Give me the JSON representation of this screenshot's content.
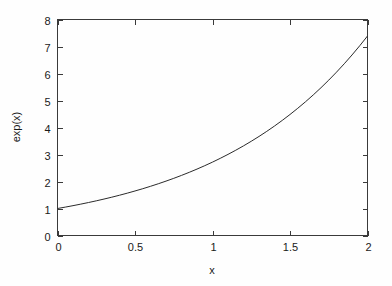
{
  "chart_data": {
    "type": "line",
    "title": "",
    "xlabel": "x",
    "ylabel": "exp(x)",
    "xlim": [
      0,
      2
    ],
    "ylim": [
      0,
      8
    ],
    "grid": false,
    "legend": false,
    "xticks": [
      0,
      0.5,
      1,
      1.5,
      2
    ],
    "xtick_labels": [
      "0",
      "0.5",
      "1",
      "1.5",
      "2"
    ],
    "yticks": [
      0,
      1,
      2,
      3,
      4,
      5,
      6,
      7,
      8
    ],
    "ytick_labels": [
      "0",
      "1",
      "2",
      "3",
      "4",
      "5",
      "6",
      "7",
      "8"
    ],
    "series": [
      {
        "name": "exp(x)",
        "color": "#2b2b2b",
        "x": [
          0,
          0.05,
          0.1,
          0.15,
          0.2,
          0.25,
          0.3,
          0.35,
          0.4,
          0.45,
          0.5,
          0.55,
          0.6,
          0.65,
          0.7,
          0.75,
          0.8,
          0.85,
          0.9,
          0.95,
          1,
          1.05,
          1.1,
          1.15,
          1.2,
          1.25,
          1.3,
          1.35,
          1.4,
          1.45,
          1.5,
          1.55,
          1.6,
          1.65,
          1.7,
          1.75,
          1.8,
          1.85,
          1.9,
          1.95,
          2
        ],
        "y": [
          1,
          1.051,
          1.105,
          1.162,
          1.221,
          1.284,
          1.35,
          1.419,
          1.492,
          1.568,
          1.649,
          1.733,
          1.822,
          1.916,
          2.014,
          2.117,
          2.226,
          2.34,
          2.46,
          2.586,
          2.718,
          2.858,
          3.004,
          3.158,
          3.32,
          3.49,
          3.669,
          3.857,
          4.055,
          4.263,
          4.482,
          4.712,
          4.953,
          5.207,
          5.474,
          5.755,
          6.05,
          6.36,
          6.686,
          7.029,
          7.389
        ]
      }
    ]
  },
  "axis_labels": {
    "x_title": "x",
    "y_title": "exp(x)"
  }
}
